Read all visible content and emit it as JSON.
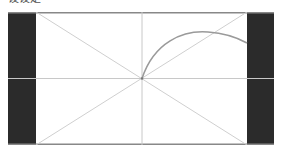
{
  "header": {
    "caption": "设设定"
  },
  "diagram": {
    "type": "composition-guide",
    "elements": [
      "letterbox-bars",
      "center-crosshair",
      "diagonal-cross",
      "arc"
    ],
    "colors": {
      "bars": "#2b2b2b",
      "frame_border": "#888888",
      "guides": "#c8c8c8",
      "arc": "#9a9a9a",
      "background": "#ffffff"
    }
  }
}
